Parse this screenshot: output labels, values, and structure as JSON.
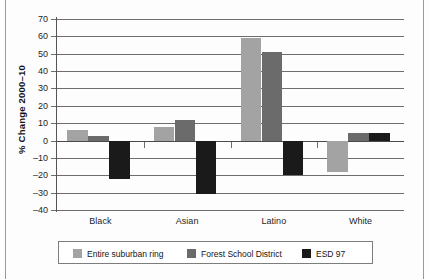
{
  "chart_data": {
    "type": "bar",
    "title": "",
    "xlabel": "",
    "ylabel": "% Change 2000–10",
    "categories": [
      "Black",
      "Asian",
      "Latino",
      "White"
    ],
    "series": [
      {
        "name": "Entire suburban ring",
        "color": "#a3a3a3",
        "values": [
          6,
          8,
          59,
          -18
        ]
      },
      {
        "name": "Forest School District",
        "color": "#6b6b6b",
        "values": [
          2.5,
          12,
          51,
          4.5
        ]
      },
      {
        "name": "ESD 97",
        "color": "#1a1a1a",
        "values": [
          -22,
          -31,
          -20,
          4.5
        ]
      }
    ],
    "ylim": [
      -40,
      70
    ],
    "ytick_step": 10,
    "ytick_labels": [
      "70",
      "60",
      "50",
      "40",
      "30",
      "20",
      "10",
      "0",
      "–10",
      "–20",
      "–30",
      "–40"
    ],
    "ytick_values": [
      70,
      60,
      50,
      40,
      30,
      20,
      10,
      0,
      -10,
      -20,
      -30,
      -40
    ],
    "grid": true,
    "legend_position": "bottom"
  },
  "legend": {
    "items": [
      {
        "label": "Entire suburban ring",
        "color": "#a3a3a3"
      },
      {
        "label": "Forest School District",
        "color": "#6b6b6b"
      },
      {
        "label": "ESD 97",
        "color": "#1a1a1a"
      }
    ]
  }
}
